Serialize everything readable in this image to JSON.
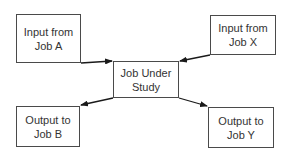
{
  "diagram": {
    "nodes": [
      {
        "id": "input-a",
        "label": "Input from\nJob A"
      },
      {
        "id": "input-x",
        "label": "Input from\nJob X"
      },
      {
        "id": "center",
        "label": "Job Under\nStudy"
      },
      {
        "id": "output-b",
        "label": "Output to\nJob B"
      },
      {
        "id": "output-y",
        "label": "Output to\nJob Y"
      }
    ],
    "edges": [
      {
        "from": "input-a",
        "to": "center"
      },
      {
        "from": "input-x",
        "to": "center"
      },
      {
        "from": "center",
        "to": "output-b"
      },
      {
        "from": "center",
        "to": "output-y"
      }
    ],
    "colors": {
      "stroke": "#4a4a4a",
      "arrow": "#1a1a1a",
      "text": "#333333",
      "background": "#ffffff"
    }
  }
}
